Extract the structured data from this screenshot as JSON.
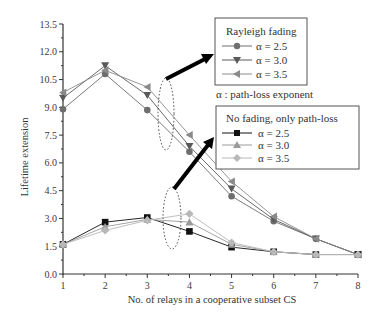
{
  "chart_data": {
    "type": "line",
    "title": "",
    "xlabel": "No. of relays in a cooperative subset CS",
    "ylabel": "Lifetime extension",
    "x": [
      1,
      2,
      3,
      4,
      5,
      6,
      7,
      8
    ],
    "xlim": [
      1,
      8
    ],
    "ylim": [
      0.0,
      13.5
    ],
    "x_ticks": [
      "1",
      "2",
      "3",
      "4",
      "5",
      "6",
      "7",
      "8"
    ],
    "y_ticks": [
      "0.0",
      "1.5",
      "3.0",
      "4.5",
      "6.0",
      "7.5",
      "9.0",
      "10.5",
      "12.0",
      "13.5"
    ],
    "grid": false,
    "series": [
      {
        "group": "Rayleigh fading",
        "name": "α = 2.5",
        "marker": "circle",
        "color": "#6e6e6e",
        "values": [
          8.9,
          10.8,
          8.85,
          6.6,
          4.2,
          2.85,
          1.9,
          1.05
        ]
      },
      {
        "group": "Rayleigh fading",
        "name": "α = 3.0",
        "marker": "triangle-down",
        "color": "#5a5a5a",
        "values": [
          9.5,
          11.25,
          9.65,
          6.9,
          4.6,
          2.95,
          1.9,
          1.05
        ]
      },
      {
        "group": "Rayleigh fading",
        "name": "α = 3.5",
        "marker": "triangle-left",
        "color": "#8a8a8a",
        "values": [
          9.8,
          11.0,
          10.1,
          7.5,
          5.0,
          3.1,
          1.9,
          1.05
        ]
      },
      {
        "group": "No fading, only path-loss",
        "name": "α = 2.5",
        "marker": "square",
        "color": "#111111",
        "values": [
          1.6,
          2.8,
          3.05,
          2.3,
          1.45,
          1.2,
          1.05,
          1.05
        ]
      },
      {
        "group": "No fading, only path-loss",
        "name": "α = 3.0",
        "marker": "triangle-up",
        "color": "#9a9a9a",
        "values": [
          1.6,
          2.55,
          2.95,
          2.8,
          1.6,
          1.2,
          1.05,
          1.05
        ]
      },
      {
        "group": "No fading, only path-loss",
        "name": "α = 3.5",
        "marker": "diamond",
        "color": "#b8b8b8",
        "values": [
          1.6,
          2.35,
          2.9,
          3.25,
          1.7,
          1.2,
          1.05,
          1.05
        ]
      }
    ],
    "legends": [
      {
        "title": "Rayleigh fading",
        "entries": [
          "α = 2.5",
          "α = 3.0",
          "α = 3.5"
        ],
        "position": "upper right"
      },
      {
        "title": "No fading, only path-loss",
        "entries": [
          "α = 2.5",
          "α = 3.0",
          "α = 3.5"
        ],
        "position": "middle right"
      }
    ],
    "annotations": [
      "α : path-loss exponent",
      "dotted ellipse around Rayleigh fading curves near x=3.5 with arrow to Rayleigh legend",
      "dotted ellipse around no-fading curves near x=3.6 with arrow to no-fading legend"
    ]
  },
  "legend_rayleigh": {
    "title": "Rayleigh fading",
    "items": [
      "α = 2.5",
      "α = 3.0",
      "α = 3.5"
    ]
  },
  "legend_nofading": {
    "title": "No fading, only path-loss",
    "items": [
      "α = 2.5",
      "α = 3.0",
      "α = 3.5"
    ]
  },
  "note": "α : path-loss exponent"
}
